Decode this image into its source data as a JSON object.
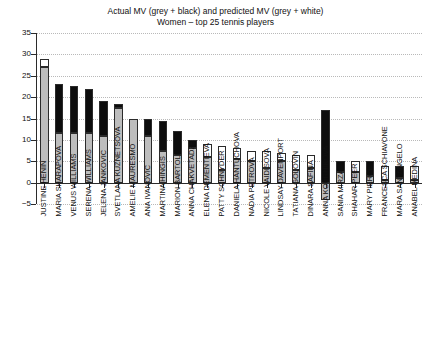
{
  "chart_data": {
    "type": "bar",
    "title": "Actual MV (grey + black) and predicted MV (grey + white)",
    "subtitle": "Women – top 25 tennis players",
    "xlabel": "",
    "ylabel": "",
    "ylim": [
      -5,
      35
    ],
    "yticks": [
      -5,
      0,
      5,
      10,
      15,
      20,
      25,
      30,
      35
    ],
    "grid": true,
    "legend": null,
    "stacking": "base grey segment with an upper cap that is black when actual MV exceeds the grey base, or white when predicted MV exceeds the grey base",
    "categories": [
      "JUSTINE HENIN",
      "MARIA SHARAPOVA",
      "VENUS WILLIAMS",
      "SERENA WILLIAMS",
      "JELENA JANKOVIC",
      "SVETLANA KUZNETSOVA",
      "AMELIE MAURESMO",
      "ANA IVANOVIC",
      "MARTINA HINGIS",
      "MARION BARTOLI",
      "ANNA CHAKVETADZE",
      "ELENA DEMENTIEVA",
      "PATTY SCHNYDER",
      "DANIELA HANTUCHOVA",
      "NADIA PETROVA",
      "NICOLE VAIDISOVA",
      "LINDSAY DAVENPORT",
      "TATIANA GOLOVIN",
      "DINARA SAFINA",
      "ANNA KOURNIKOVA",
      "SANIA MIRZA",
      "SHAHAR PEER",
      "MARY PIERCE",
      "FRANCESCA SCHIAVONE",
      "MARA SANTANGELO",
      "ANABEL MEDINA"
    ],
    "series": [
      {
        "name": "grey base",
        "values": [
          27.0,
          11.5,
          11.5,
          11.5,
          11.0,
          17.5,
          15.0,
          11.0,
          7.5,
          6.5,
          8.0,
          6.0,
          3.0,
          5.5,
          5.0,
          3.5,
          5.0,
          3.0,
          3.5,
          -4.0,
          2.5,
          2.5,
          1.5,
          0.5,
          1.0,
          0.5
        ]
      },
      {
        "name": "cap top",
        "values": [
          29.0,
          23.0,
          22.5,
          22.0,
          19.0,
          18.5,
          15.0,
          15.0,
          14.5,
          12.0,
          10.0,
          9.0,
          8.5,
          8.0,
          7.5,
          7.5,
          7.0,
          6.5,
          6.5,
          17.0,
          5.0,
          5.0,
          5.0,
          4.0,
          4.0,
          4.0
        ]
      }
    ],
    "cap_colors": [
      "white",
      "black",
      "black",
      "black",
      "black",
      "black",
      "none",
      "black",
      "black",
      "black",
      "black",
      "white",
      "white",
      "white",
      "white",
      "white",
      "white",
      "white",
      "white",
      "black",
      "black",
      "white",
      "black",
      "white",
      "black",
      "white"
    ]
  },
  "colors": {
    "grey": "#bdbdbd",
    "black": "#0d0d0d",
    "white": "#ffffff",
    "axis": "#2b2b2b",
    "grid": "#b9b9b9",
    "background": "#ffffff"
  }
}
